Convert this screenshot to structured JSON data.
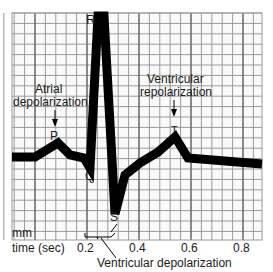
{
  "diagram": {
    "grid": {
      "small_division_label": "mm",
      "colors": {
        "minor": "#9a9a9a",
        "major": "#6e6e6e",
        "background": "#fafafa"
      }
    },
    "axis": {
      "label": "time (sec)",
      "ticks": [
        "0.2",
        "0.4",
        "0.6",
        "0.8"
      ]
    },
    "waves": {
      "P": "P",
      "Q": "Q",
      "R": "R",
      "S": "S",
      "T": "T"
    },
    "annotations": {
      "atrial_line1": "Atrial",
      "atrial_line2": "depolarization",
      "ventricular_repol_line1": "Ventricular",
      "ventricular_repol_line2": "repolarization",
      "ventricular_depol": "Ventricular depolarization"
    },
    "trace_color": "#000000"
  }
}
